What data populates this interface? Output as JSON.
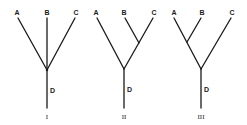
{
  "figure": {
    "trees": [
      {
        "id": "I",
        "numeral": "I",
        "topology": "unresolved polytomy (A,B,C)",
        "tips": [
          {
            "label": "A",
            "x": 17,
            "y": 13
          },
          {
            "label": "B",
            "x": 47,
            "y": 13
          },
          {
            "label": "C",
            "x": 75,
            "y": 13
          }
        ],
        "root_label": "D"
      },
      {
        "id": "II",
        "numeral": "II",
        "topology": "(A,(B,C))",
        "tips": [
          {
            "label": "A",
            "x": 96,
            "y": 13
          },
          {
            "label": "B",
            "x": 124,
            "y": 13
          },
          {
            "label": "C",
            "x": 153,
            "y": 13
          }
        ],
        "root_label": "D"
      },
      {
        "id": "III",
        "numeral": "III",
        "topology": "((A,B),C)",
        "tips": [
          {
            "label": "A",
            "x": 174,
            "y": 13
          },
          {
            "label": "B",
            "x": 201,
            "y": 13
          },
          {
            "label": "C",
            "x": 231,
            "y": 13
          }
        ],
        "root_label": "D"
      }
    ]
  }
}
